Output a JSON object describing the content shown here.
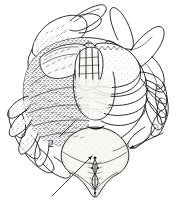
{
  "figure": {
    "kind": "scientific-line-drawing",
    "subject": "crab",
    "view": "ventral",
    "technique": "pen-and-ink stipple and hatch",
    "background_color": "#ffffff",
    "ink_color": "#1a1a1a",
    "shade_color": "#f2efe9",
    "width_px": 182,
    "height_px": 206
  },
  "annotations": [
    {
      "id": "label-2",
      "text": "2",
      "x": 51,
      "y": 147,
      "leader_from_x": 59,
      "leader_from_y": 137,
      "leader_to_x": 75,
      "leader_to_y": 121,
      "points_at": "sternum-and-pereiopod-junction"
    }
  ],
  "pointer_arrows": [
    {
      "id": "arrow-apron",
      "from_x": 52,
      "from_y": 196,
      "to_x": 92,
      "to_y": 156,
      "points_at": "abdominal-apron"
    },
    {
      "id": "arrow-right-walking-leg",
      "from_x": 163,
      "from_y": 133,
      "to_x": 130,
      "to_y": 148,
      "points_at": "right-walking-leg"
    }
  ],
  "anatomy_parts": [
    {
      "id": "left-cheliped",
      "label": "Left cheliped (claw)",
      "side": "left"
    },
    {
      "id": "right-cheliped",
      "label": "Right cheliped (claw)",
      "side": "right"
    },
    {
      "id": "left-pereiopods",
      "label": "Left walking legs",
      "side": "left"
    },
    {
      "id": "right-pereiopods",
      "label": "Right walking legs",
      "side": "right"
    },
    {
      "id": "sternum",
      "label": "Sternum",
      "side": "centre"
    },
    {
      "id": "abdominal-apron",
      "label": "Abdominal apron",
      "side": "centre"
    },
    {
      "id": "mouthparts",
      "label": "Maxillipeds / mouthparts",
      "side": "centre"
    },
    {
      "id": "carapace-margin",
      "label": "Carapace margin",
      "side": "centre"
    }
  ]
}
